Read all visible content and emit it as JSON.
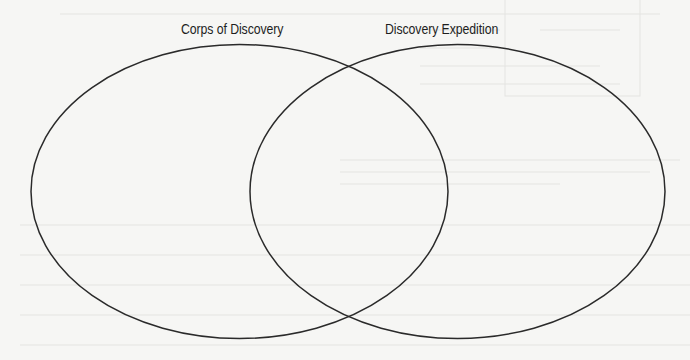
{
  "diagram": {
    "type": "venn",
    "sets": [
      {
        "id": "left",
        "label": "Corps of Discovery",
        "ellipse": {
          "cx": 239.5,
          "cy": 191.5,
          "rx": 208.5,
          "ry": 147
        }
      },
      {
        "id": "right",
        "label": "Discovery Expedition",
        "ellipse": {
          "cx": 457.5,
          "cy": 191.5,
          "rx": 207.5,
          "ry": 147
        }
      }
    ],
    "stroke_color": "#2a2a2a",
    "stroke_width": 1.5,
    "background_color": "#f6f6f4"
  }
}
